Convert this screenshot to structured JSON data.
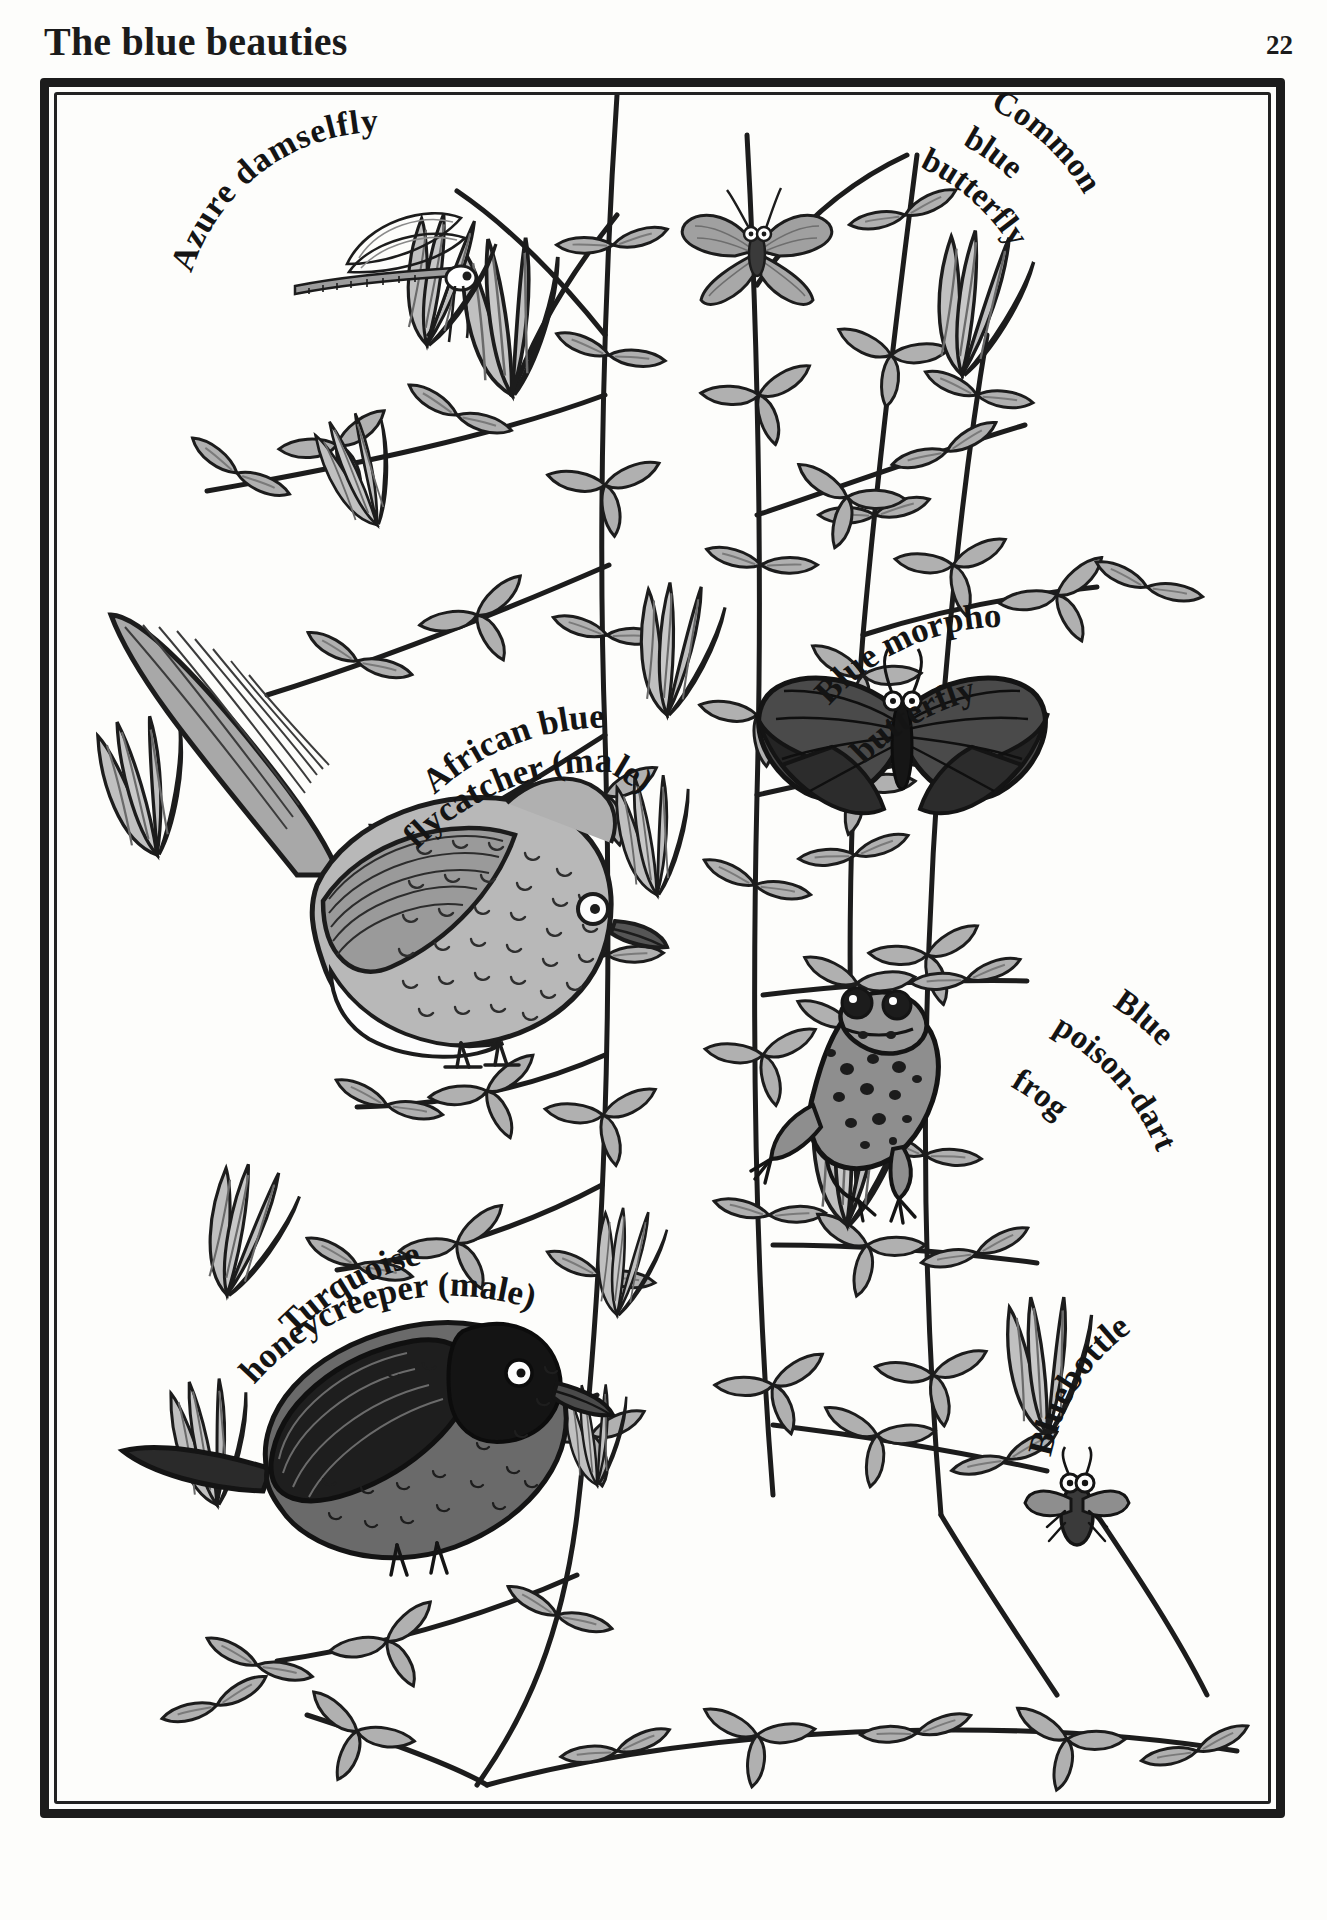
{
  "header": {
    "title": "The blue beauties",
    "page_number": "22"
  },
  "plate": {
    "style": "hand-drawn pen-and-ink botanical plate, grayscale",
    "frame": "double hand-drawn rectangular border"
  },
  "labels": [
    {
      "id": "azure-damselfly",
      "text": "Azure damselfly",
      "lines": [
        "Azure damselfly"
      ],
      "layout": "arc-up"
    },
    {
      "id": "common-blue",
      "text": "Common blue butterfly",
      "lines": [
        "Common",
        "blue",
        "butterfly"
      ],
      "layout": "diagonal-stack"
    },
    {
      "id": "blue-morpho",
      "text": "Blue morpho butterfly",
      "lines": [
        "Blue morpho",
        "butterfly"
      ],
      "layout": "arc-up"
    },
    {
      "id": "african-flycatcher",
      "text": "African blue flycatcher (male)",
      "lines": [
        "African blue",
        "flycatcher (male)"
      ],
      "layout": "arc-up"
    },
    {
      "id": "turquoise-honeycreeper",
      "text": "Turquoise honeycreeper (male)",
      "lines": [
        "Turquoise",
        "honeycreeper (male)"
      ],
      "layout": "arc-up"
    },
    {
      "id": "blue-poison-dart-frog",
      "text": "Blue poison-dart frog",
      "lines": [
        "Blue",
        "poison-dart",
        "frog"
      ],
      "layout": "diagonal-stack"
    },
    {
      "id": "bluebottle",
      "text": "Bluebottle",
      "lines": [
        "Bluebottle"
      ],
      "layout": "arc-up"
    }
  ],
  "specimens": [
    {
      "name": "Azure damselfly",
      "kind": "insect"
    },
    {
      "name": "Common blue butterfly",
      "kind": "insect"
    },
    {
      "name": "Blue morpho butterfly",
      "kind": "insect"
    },
    {
      "name": "African blue flycatcher (male)",
      "kind": "bird"
    },
    {
      "name": "Turquoise honeycreeper (male)",
      "kind": "bird"
    },
    {
      "name": "Blue poison-dart frog",
      "kind": "amphibian"
    },
    {
      "name": "Bluebottle",
      "kind": "insect"
    }
  ],
  "colors": {
    "ink": "#1c1c1c",
    "paper": "#fdfdfb",
    "leaf_fill": "#a9a9a9",
    "leaf_fill_light": "#bdbdbd",
    "bird_body": "#b5b5b5",
    "bird_dark": "#3a3a3a",
    "butterfly_dark": "#2e2e2e",
    "butterfly_mid": "#565656"
  }
}
